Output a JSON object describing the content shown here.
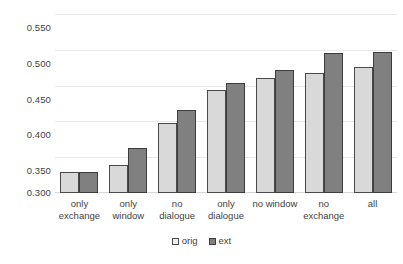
{
  "chart_data": {
    "type": "bar",
    "title": "",
    "xlabel": "",
    "ylabel": "",
    "categories": [
      "only\nexchange",
      "only\nwindow",
      "no\ndialogue",
      "only\ndialogue",
      "no window",
      "no\nexchange",
      "all"
    ],
    "series": [
      {
        "name": "orig",
        "color": "#d9d9d9",
        "values": [
          0.329,
          0.339,
          0.398,
          0.444,
          0.461,
          0.467,
          0.476
        ]
      },
      {
        "name": "ext",
        "color": "#808080",
        "values": [
          0.329,
          0.363,
          0.416,
          0.454,
          0.472,
          0.496,
          0.497
        ]
      }
    ],
    "ylim": [
      0.3,
      0.55
    ],
    "yticks": [
      0.3,
      0.35,
      0.4,
      0.45,
      0.5,
      0.55
    ],
    "ytick_labels": [
      "0.300",
      "0.350",
      "0.400",
      "0.450",
      "0.500",
      "0.550"
    ],
    "grid": true,
    "legend_position": "bottom"
  },
  "legend": {
    "items": [
      {
        "label": "orig",
        "swatch": "light-gray-square-icon"
      },
      {
        "label": "ext",
        "swatch": "dark-gray-square-icon"
      }
    ]
  }
}
